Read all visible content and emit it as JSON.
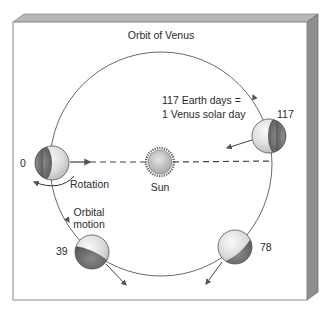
{
  "title": "Orbit of Venus",
  "annotation": {
    "line1": "117 Earth days =",
    "line2": "1 Venus solar day"
  },
  "sun": {
    "label": "Sun"
  },
  "labels": {
    "rotation": "Rotation",
    "orbital_motion_line1": "Orbital",
    "orbital_motion_line2": "motion"
  },
  "positions": [
    {
      "day": "0"
    },
    {
      "day": "39"
    },
    {
      "day": "78"
    },
    {
      "day": "117"
    }
  ],
  "colors": {
    "frame_face": "#ffffff",
    "frame_edge": "#9a9a9a",
    "frame_side": "#8c8c8c",
    "frame_top": "#b4b4b4",
    "orbit": "#666666",
    "planet_light": "#e8e8e8",
    "planet_dark": "#6e6e6e",
    "sun": "#c8c8c8"
  }
}
